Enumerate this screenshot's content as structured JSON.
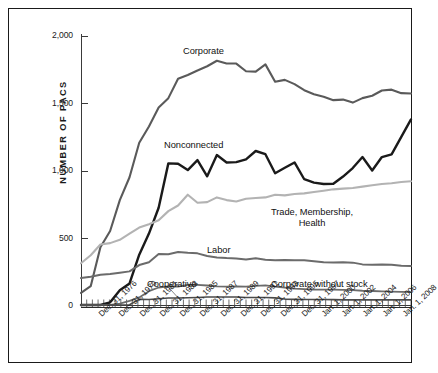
{
  "figure": {
    "frame_border_color": "#1a1a1a",
    "background": "#ffffff"
  },
  "chart_data": {
    "type": "line",
    "title": "",
    "xlabel": "",
    "ylabel": "NUMBER OF PACS",
    "ylim": [
      0,
      2000
    ],
    "yticks": [
      0,
      500,
      1000,
      1500,
      2000
    ],
    "ytick_labels": [
      "0",
      "500",
      "1,000",
      "1,500",
      "2,000"
    ],
    "grid": false,
    "legend_position": "inline-annotations",
    "xtick_labels": [
      "Dec. 31, 1976",
      "Dec. 31, 1979",
      "Dec. 31, 1981",
      "Dec. 31, 1983",
      "Dec. 31, 1985",
      "Dec. 31, 1987",
      "Dec. 31, 1989",
      "Dec. 31, 1991",
      "Dec. 31, 1993",
      "Dec. 31, 1995",
      "Dec. 31, 1997",
      "Jan. 1, 2000",
      "Jan. 1, 2002",
      "Jan. 1, 2004",
      "Jan. 1, 2006",
      "Jan. 1, 2008"
    ],
    "x": [
      1974,
      1975,
      1976,
      1977,
      1978,
      1979,
      1980,
      1981,
      1982,
      1983,
      1984,
      1985,
      1986,
      1987,
      1988,
      1989,
      1990,
      1991,
      1992,
      1993,
      1994,
      1995,
      1996,
      1997,
      1998,
      1999,
      2000,
      2001,
      2002,
      2003,
      2004,
      2005,
      2006,
      2007,
      2008
    ],
    "series": [
      {
        "name": "Corporate",
        "color": "#5a5a5a",
        "width": 2.1,
        "values": [
          90,
          140,
          430,
          550,
          780,
          950,
          1206,
          1327,
          1469,
          1538,
          1682,
          1710,
          1744,
          1775,
          1816,
          1796,
          1795,
          1738,
          1735,
          1789,
          1660,
          1674,
          1642,
          1597,
          1567,
          1548,
          1523,
          1527,
          1505,
          1538,
          1556,
          1595,
          1601,
          1575,
          1573
        ]
      },
      {
        "name": "Nonconnected",
        "color": "#1a1a1a",
        "width": 2.4,
        "values": [
          0,
          0,
          0,
          20,
          110,
          160,
          374,
          531,
          723,
          1053,
          1050,
          1003,
          1077,
          957,
          1115,
          1060,
          1062,
          1083,
          1145,
          1121,
          980,
          1020,
          1060,
          935,
          910,
          900,
          902,
          955,
          1018,
          1100,
          1000,
          1100,
          1120,
          1250,
          1380
        ]
      },
      {
        "name": "Trade, Membership, Health",
        "color": "#b3b3b3",
        "width": 2.1,
        "values": [
          310,
          370,
          450,
          460,
          485,
          530,
          576,
          601,
          630,
          698,
          740,
          820,
          760,
          765,
          800,
          780,
          770,
          790,
          795,
          800,
          820,
          815,
          825,
          830,
          840,
          850,
          860,
          865,
          870,
          880,
          890,
          900,
          905,
          915,
          920
        ]
      },
      {
        "name": "Labor",
        "color": "#6b6b6b",
        "width": 2.0,
        "values": [
          200,
          210,
          225,
          230,
          240,
          250,
          297,
          318,
          380,
          378,
          394,
          388,
          384,
          364,
          354,
          349,
          346,
          338,
          347,
          337,
          333,
          334,
          332,
          332,
          326,
          318,
          316,
          317,
          315,
          302,
          300,
          302,
          300,
          292,
          290
        ]
      },
      {
        "name": "Corporate without stock",
        "color": "#6b6b6b",
        "width": 1.8,
        "values": [
          0,
          0,
          0,
          0,
          10,
          30,
          56,
          103,
          130,
          139,
          136,
          149,
          150,
          145,
          138,
          136,
          138,
          137,
          142,
          146,
          136,
          129,
          122,
          118,
          115,
          114,
          114,
          112,
          110,
          106,
          104,
          102,
          100,
          98,
          96
        ]
      },
      {
        "name": "Cooperative",
        "color": "#4a4a4a",
        "width": 1.6,
        "values": [
          0,
          0,
          0,
          0,
          0,
          2,
          42,
          41,
          47,
          52,
          52,
          54,
          56,
          59,
          59,
          59,
          59,
          56,
          56,
          56,
          53,
          44,
          42,
          41,
          41,
          41,
          40,
          38,
          38,
          38,
          38,
          38,
          38,
          38,
          38
        ]
      }
    ],
    "annotations": [
      {
        "label": "Corporate",
        "series": "Corporate"
      },
      {
        "label": "Nonconnected",
        "series": "Nonconnected"
      },
      {
        "label": "Trade, Membership,\nHealth",
        "series": "Trade, Membership, Health"
      },
      {
        "label": "Labor",
        "series": "Labor"
      },
      {
        "label": "Corporate without stock",
        "series": "Corporate without stock"
      },
      {
        "label": "Cooperative",
        "series": "Cooperative",
        "has_leader_line": true
      }
    ]
  },
  "labels": {
    "y_axis_title": "NUMBER OF PACS",
    "corporate": "Corporate",
    "nonconnected": "Nonconnected",
    "trade_line1": "Trade, Membership,",
    "trade_line2": "Health",
    "labor": "Labor",
    "corporate_without_stock": "Corporate without stock",
    "cooperative": "Cooperative",
    "ytick_0": "0",
    "ytick_500": "500",
    "ytick_1000": "1,000",
    "ytick_1500": "1,500",
    "ytick_2000": "2,000"
  }
}
